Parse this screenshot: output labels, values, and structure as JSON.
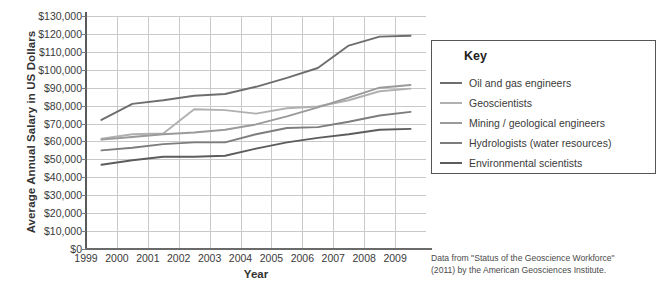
{
  "chart_data": {
    "type": "line",
    "title": "",
    "xlabel": "Year",
    "ylabel": "Average Annual Salary in US Dollars",
    "xlim": [
      1999,
      2010
    ],
    "ylim": [
      0,
      130000
    ],
    "grid": true,
    "legend_position": "right",
    "legend_title": "Key",
    "x": [
      1999.5,
      2000.5,
      2001.5,
      2002.5,
      2003.5,
      2004.5,
      2005.5,
      2006.5,
      2007.5,
      2008.5,
      2009.5
    ],
    "xtick_labels": [
      "1999",
      "2000",
      "2001",
      "2002",
      "2003",
      "2004",
      "2005",
      "2006",
      "2007",
      "2008",
      "2009"
    ],
    "ytick_labels": [
      "$130,000",
      "$120,000",
      "$110,000",
      "$100,000",
      "$90,000",
      "$80,000",
      "$70,000",
      "$60,000",
      "$50,000",
      "$40,000",
      "$30,000",
      "$20,000",
      "$10,000",
      "$0"
    ],
    "ytick_values": [
      130000,
      120000,
      110000,
      100000,
      90000,
      80000,
      70000,
      60000,
      50000,
      40000,
      30000,
      20000,
      10000,
      0
    ],
    "series": [
      {
        "name": "Oil and gas engineers",
        "color": "#6e6e6e",
        "values": [
          72000,
          81000,
          83000,
          85500,
          86500,
          90500,
          95500,
          101000,
          113500,
          118500,
          119000
        ]
      },
      {
        "name": "Geoscientists",
        "color": "#b0b0b0",
        "values": [
          61500,
          64000,
          64500,
          78000,
          77500,
          75500,
          78500,
          79500,
          83000,
          88000,
          89500
        ]
      },
      {
        "name": "Mining / geological engineers",
        "color": "#9a9a9a",
        "values": [
          61000,
          62500,
          64000,
          65000,
          66500,
          69500,
          74000,
          79000,
          84500,
          90000,
          91500
        ]
      },
      {
        "name": "Hydrologists (water resources)",
        "color": "#7d7d7d",
        "values": [
          55000,
          56500,
          58500,
          59500,
          59500,
          64000,
          67500,
          68000,
          71000,
          74500,
          76500
        ]
      },
      {
        "name": "Environmental scientists",
        "color": "#5c5c5c",
        "values": [
          47000,
          49500,
          51500,
          51500,
          52000,
          56000,
          59500,
          62000,
          64000,
          66500,
          67000
        ]
      }
    ]
  },
  "source_note": {
    "line1": "Data from \"Status of the Geoscience Workforce\"",
    "line2": "(2011) by the American Geosciences Institute."
  }
}
